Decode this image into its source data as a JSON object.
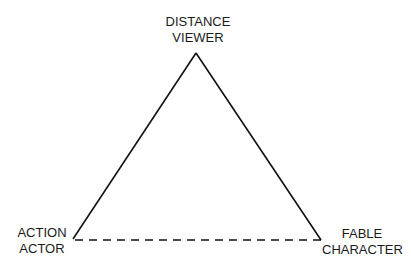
{
  "diagram": {
    "type": "triangle",
    "vertices": {
      "top": {
        "line1": "DISTANCE",
        "line2": "VIEWER"
      },
      "left": {
        "line1": "ACTION",
        "line2": "ACTOR"
      },
      "right": {
        "line1": "FABLE",
        "line2": "CHARACTER"
      }
    },
    "edges": [
      {
        "from": "top",
        "to": "left",
        "style": "solid"
      },
      {
        "from": "top",
        "to": "right",
        "style": "solid"
      },
      {
        "from": "left",
        "to": "right",
        "style": "dashed"
      }
    ],
    "colors": {
      "line": "#111111",
      "text": "#1a1a1a",
      "background": "#ffffff"
    }
  }
}
